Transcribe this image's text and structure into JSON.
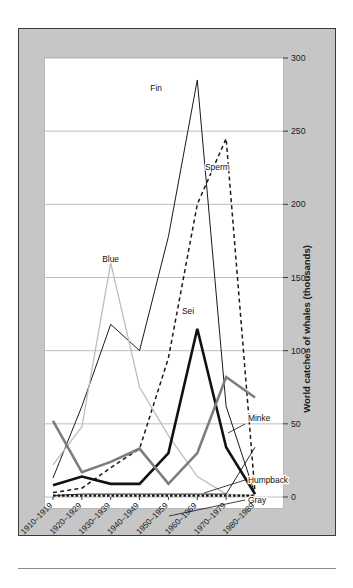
{
  "figure": {
    "background_color": "#ffffff",
    "plate_color": "#c6c6c6",
    "plate_border_color": "#3a3a3a",
    "panel_color": "#ffffff"
  },
  "chart_data": {
    "type": "line",
    "title": "",
    "xlabel": "",
    "ylabel": "World catches of whales (thousands)",
    "ylim": [
      0,
      300
    ],
    "yticks": [
      0,
      50,
      100,
      150,
      200,
      250,
      300
    ],
    "ytick_labels": [
      "0",
      "50",
      "100",
      "150",
      "200",
      "250",
      "300"
    ],
    "grid": true,
    "grid_color": "#b7b7b7",
    "legend_position": "inline-labels",
    "categories": [
      "1910–1919",
      "1920–1929",
      "1930–1939",
      "1940–1949",
      "1950–1959",
      "1960–1969",
      "1970–1979",
      "1980–1989"
    ],
    "series": [
      {
        "name": "Fin",
        "values": [
          13,
          62,
          118,
          100,
          178,
          285,
          62,
          2
        ],
        "color": "#1a1a1a",
        "width": 1.0,
        "dash": "none",
        "label_x": 120,
        "label_y": 80
      },
      {
        "name": "Sperm",
        "values": [
          3,
          6,
          20,
          33,
          95,
          200,
          245,
          3
        ],
        "color": "#1a1a1a",
        "width": 1.5,
        "dash": "dashed",
        "label_x": 186,
        "label_y": 141
      },
      {
        "name": "Blue",
        "values": [
          22,
          48,
          160,
          75,
          42,
          14,
          2,
          1
        ],
        "color": "#bdbdbd",
        "width": 1.3,
        "dash": "none",
        "label_x": 74,
        "label_y": 233
      },
      {
        "name": "Sei",
        "values": [
          8,
          14,
          9,
          9,
          30,
          115,
          34,
          2
        ],
        "color": "#111111",
        "width": 2.6,
        "dash": "none",
        "label_x": 161,
        "label_y": 283
      },
      {
        "name": "Minke",
        "values": [
          52,
          17,
          24,
          33,
          9,
          30,
          82,
          68
        ],
        "color": "#7d7d7d",
        "width": 2.6,
        "dash": "none",
        "label_x": 233,
        "label_y": 391
      },
      {
        "name": "Humpback",
        "values": [
          1,
          2,
          2,
          2,
          2,
          2,
          2,
          34
        ],
        "color": "#111111",
        "width": 0.9,
        "dash": "none",
        "label_x": 233,
        "label_y": 452
      },
      {
        "name": "Gray",
        "values": [
          1,
          1,
          1,
          1,
          1,
          1,
          1,
          1
        ],
        "color": "#111111",
        "width": 2.2,
        "dash": "dotted",
        "label_x": 233,
        "label_y": 473
      }
    ]
  }
}
